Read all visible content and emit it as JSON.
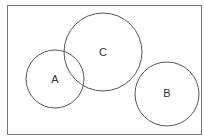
{
  "diagram": {
    "type": "venn",
    "frame": {
      "x": 7.5,
      "y": 5.5,
      "width": 194,
      "height": 129,
      "stroke": "#777777"
    },
    "circles": [
      {
        "id": "A",
        "label": "A",
        "cx": 55,
        "cy": 79,
        "r": 29
      },
      {
        "id": "C",
        "label": "C",
        "cx": 103,
        "cy": 52,
        "r": 39
      },
      {
        "id": "B",
        "label": "B",
        "cx": 167,
        "cy": 94,
        "r": 32
      }
    ],
    "relationships": [
      {
        "sets": [
          "A",
          "C"
        ],
        "relation": "overlap"
      },
      {
        "sets": [
          "A",
          "B"
        ],
        "relation": "disjoint"
      },
      {
        "sets": [
          "B",
          "C"
        ],
        "relation": "disjoint"
      }
    ],
    "stroke_color": "#555555"
  }
}
